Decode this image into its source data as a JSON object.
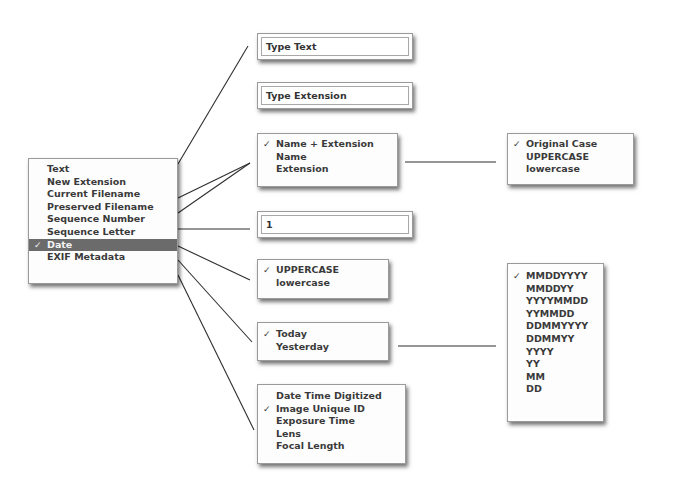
{
  "source_menu": {
    "items": [
      {
        "label": "Text",
        "checked": false
      },
      {
        "label": "New Extension",
        "checked": false
      },
      {
        "label": "Current Filename",
        "checked": false
      },
      {
        "label": "Preserved Filename",
        "checked": false
      },
      {
        "label": "Sequence Number",
        "checked": false
      },
      {
        "label": "Sequence Letter",
        "checked": false
      },
      {
        "label": "Date",
        "checked": true
      },
      {
        "label": "EXIF Metadata",
        "checked": false
      }
    ]
  },
  "text_field": {
    "value": "Type Text"
  },
  "extension_field": {
    "value": "Type Extension"
  },
  "filename_menu": {
    "items": [
      {
        "label": "Name + Extension",
        "checked": true
      },
      {
        "label": "Name",
        "checked": false
      },
      {
        "label": "Extension",
        "checked": false
      }
    ]
  },
  "case_menu": {
    "items": [
      {
        "label": "Original Case",
        "checked": true
      },
      {
        "label": "UPPERCASE",
        "checked": false
      },
      {
        "label": "lowercase",
        "checked": false
      }
    ]
  },
  "sequence_number_field": {
    "value": "1"
  },
  "letter_case_menu": {
    "items": [
      {
        "label": "UPPERCASE",
        "checked": true
      },
      {
        "label": "lowercase",
        "checked": false
      }
    ]
  },
  "date_menu": {
    "items": [
      {
        "label": "Today",
        "checked": true
      },
      {
        "label": "Yesterday",
        "checked": false
      }
    ]
  },
  "date_format_menu": {
    "items": [
      {
        "label": "MMDDYYYY",
        "checked": true
      },
      {
        "label": "MMDDYY",
        "checked": false
      },
      {
        "label": "YYYYMMDD",
        "checked": false
      },
      {
        "label": "YYMMDD",
        "checked": false
      },
      {
        "label": "DDMMYYYY",
        "checked": false
      },
      {
        "label": "DDMMYY",
        "checked": false
      },
      {
        "label": "YYYY",
        "checked": false
      },
      {
        "label": "YY",
        "checked": false
      },
      {
        "label": "MM",
        "checked": false
      },
      {
        "label": "DD",
        "checked": false
      }
    ]
  },
  "exif_menu": {
    "items": [
      {
        "label": "Date Time Digitized",
        "checked": false
      },
      {
        "label": "Image Unique ID",
        "checked": true
      },
      {
        "label": "Exposure Time",
        "checked": false
      },
      {
        "label": "Lens",
        "checked": false
      },
      {
        "label": "Focal Length",
        "checked": false
      }
    ]
  },
  "check_glyph": "✓"
}
